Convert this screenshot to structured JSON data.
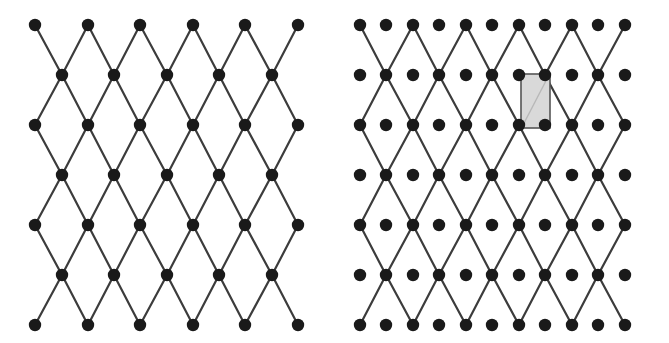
{
  "figure": {
    "title": "",
    "background": "#ffffff",
    "width": 669,
    "height": 343
  },
  "style": {
    "node_color": "#1a1a1a",
    "node_radius": 6.2,
    "edge_color": "#3c3c3c",
    "edge_width": 2.2,
    "cell_fill": "#d9d9d9",
    "cell_stroke": "#555555",
    "cell_stroke_width": 1.6
  },
  "panels": [
    {
      "id": "left-lattice",
      "name": "centred-rectangular-lattice-plain",
      "origin_x": 0,
      "origin_y": 0,
      "width": 335,
      "height": 343,
      "grid": {
        "description": "diamond (centred rectangular) lattice of nodes joined by edges",
        "col_spacing": 52.6,
        "row_spacing": 50,
        "x0": 35,
        "y0": 25,
        "n_even_cols": 6,
        "n_odd_cols": 5,
        "n_rows": 7,
        "even_row_cols_x": [
          35,
          88,
          140,
          193,
          245,
          298
        ],
        "odd_row_cols_x": [
          62,
          114,
          167,
          219,
          272
        ],
        "rows_y": [
          25,
          75,
          125,
          175,
          225,
          275,
          325
        ]
      },
      "unit_cell": null
    },
    {
      "id": "right-lattice",
      "name": "centred-rectangular-lattice-with-basis",
      "origin_x": 335,
      "origin_y": 0,
      "width": 334,
      "height": 343,
      "grid": {
        "description": "same lattice of edges, but every row carries a full set of nodes including the interstitial basis points",
        "col_spacing": 26.3,
        "row_spacing": 50,
        "x0": 25,
        "y0": 25,
        "n_cols": 11,
        "n_rows": 7,
        "cols_x": [
          25,
          51,
          78,
          104,
          131,
          157,
          184,
          210,
          237,
          263,
          290
        ],
        "rows_y": [
          25,
          75,
          125,
          175,
          225,
          275,
          325
        ],
        "lattice_even_cols": [
          0,
          2,
          4,
          6,
          8,
          10
        ],
        "lattice_odd_cols": [
          1,
          3,
          5,
          7,
          9
        ]
      },
      "unit_cell": {
        "label": "",
        "x": 186,
        "y": 74,
        "width": 29,
        "height": 54,
        "fill": "#d9d9d9",
        "stroke": "#555555",
        "has_internal_diagonal": true
      }
    }
  ],
  "caption": ""
}
